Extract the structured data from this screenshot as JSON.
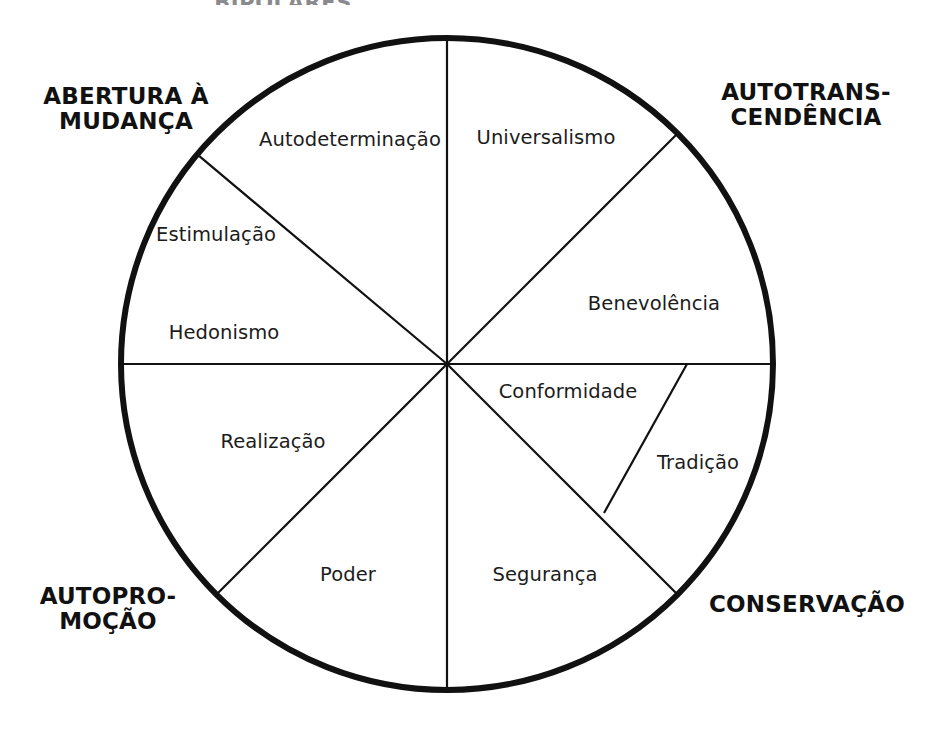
{
  "page": {
    "cut_off_heading": "BIPOLARES",
    "background_color": "#ffffff",
    "stroke_color": "#111111"
  },
  "diagram": {
    "type": "circumplex-wheel",
    "center": {
      "x": 447,
      "y": 364
    },
    "radius": 326,
    "outer_stroke_width": 6,
    "divider_stroke_width": 2.2,
    "higher_order_poles": [
      {
        "id": "openness-to-change",
        "label": "ABERTURA À\nMUDANÇA",
        "position": "top-left"
      },
      {
        "id": "self-transcendence",
        "label": "AUTOTRANS-\nCENDÊNCIA",
        "position": "top-right"
      },
      {
        "id": "self-enhancement",
        "label": "AUTOPRO-\nMOÇÃO",
        "position": "bottom-left"
      },
      {
        "id": "conservation",
        "label": "CONSERVAÇÃO",
        "position": "bottom-right"
      }
    ],
    "values": [
      {
        "id": "autodeterminacao",
        "label": "Autodeterminação",
        "x": 350,
        "y": 139
      },
      {
        "id": "universalismo",
        "label": "Universalismo",
        "x": 546,
        "y": 137
      },
      {
        "id": "estimulacao",
        "label": "Estimulação",
        "x": 216,
        "y": 234
      },
      {
        "id": "benevolencia",
        "label": "Benevolência",
        "x": 654,
        "y": 303
      },
      {
        "id": "hedonismo",
        "label": "Hedonismo",
        "x": 224,
        "y": 332
      },
      {
        "id": "conformidade",
        "label": "Conformidade",
        "x": 568,
        "y": 391
      },
      {
        "id": "realizacao",
        "label": "Realização",
        "x": 273,
        "y": 441
      },
      {
        "id": "tradicao",
        "label": "Tradição",
        "x": 698,
        "y": 462
      },
      {
        "id": "poder",
        "label": "Poder",
        "x": 348,
        "y": 574
      },
      {
        "id": "seguranca",
        "label": "Segurança",
        "x": 545,
        "y": 574
      }
    ],
    "divider_angles_deg": [
      90,
      45,
      0,
      -45,
      -90,
      -135,
      180,
      140
    ],
    "tradicao_wedge": {
      "outer_start": {
        "x": 687,
        "y": 364
      },
      "inner_point": {
        "x": 604,
        "y": 513
      }
    }
  }
}
